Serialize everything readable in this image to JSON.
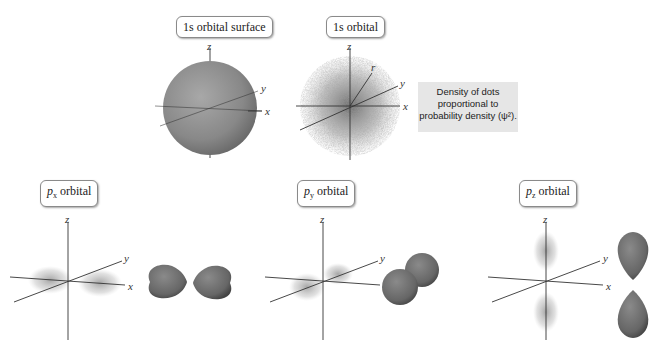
{
  "panels": {
    "s_surface": {
      "label_prefix": "1s",
      "label_suffix": " orbital surface",
      "axes": {
        "x": "x",
        "y": "y",
        "z": "z"
      }
    },
    "s_density": {
      "label_prefix": "1s",
      "label_suffix": " orbital",
      "axes": {
        "x": "x",
        "y": "y",
        "z": "z",
        "r": "r"
      }
    },
    "px": {
      "label_p": "p",
      "label_sub": "x",
      "label_suffix": " orbital",
      "axes": {
        "x": "x",
        "y": "y",
        "z": "z"
      }
    },
    "py": {
      "label_p": "p",
      "label_sub": "y",
      "label_suffix": " orbital",
      "axes": {
        "x": "x",
        "y": "y",
        "z": "z"
      }
    },
    "pz": {
      "label_p": "p",
      "label_sub": "z",
      "label_suffix": " orbital",
      "axes": {
        "x": "x",
        "y": "y",
        "z": "z"
      }
    }
  },
  "caption": {
    "line1": "Density of dots",
    "line2": "proportional to",
    "line3": "probability density  (ψ²)."
  },
  "colors": {
    "orbital_surface": "#8a8a8a",
    "lobe": "#6e6e6e",
    "caption_bg": "#e6e6e6",
    "axis": "#333333"
  }
}
